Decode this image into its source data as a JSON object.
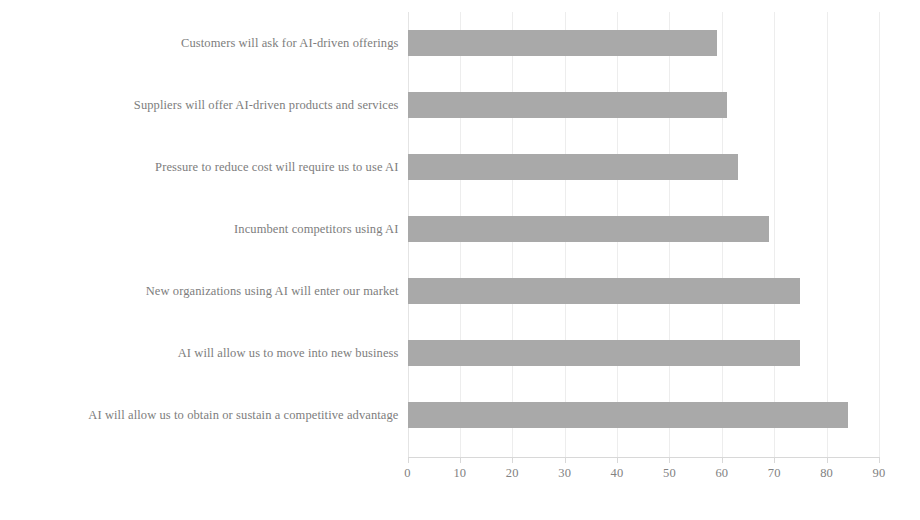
{
  "chart_data": {
    "type": "bar",
    "orientation": "horizontal",
    "title": "",
    "subtitle": "",
    "xlabel": "",
    "ylabel": "",
    "categories": [
      "Customers will ask for AI-driven offerings",
      "Suppliers will offer AI-driven products and services",
      "Pressure to reduce cost will require us to use AI",
      "Incumbent competitors using AI",
      "New organizations using AI will enter our market",
      "AI will allow us to move into new business",
      "AI will allow us to obtain or sustain a competitive advantage"
    ],
    "values": [
      59,
      61,
      63,
      69,
      75,
      75,
      84
    ],
    "xlim": [
      0,
      90
    ],
    "xticks": [
      0,
      10,
      20,
      30,
      40,
      50,
      60,
      70,
      80,
      90
    ],
    "xtick_labels": [
      "0",
      "10",
      "20",
      "30",
      "40",
      "50",
      "60",
      "70",
      "80",
      "90"
    ],
    "grid": true,
    "grid_axis": "x",
    "legend": false,
    "legend_position": "none",
    "series": [
      {
        "name": "",
        "values": [
          59,
          61,
          63,
          69,
          75,
          75,
          84
        ]
      }
    ]
  },
  "style": {
    "bar_color": "#a9a9a9",
    "gridline_color": "#ededed",
    "axis_color": "#d8d8d8",
    "label_color": "#7d7d7d",
    "tick_label_color": "#828282",
    "background": "#ffffff"
  }
}
